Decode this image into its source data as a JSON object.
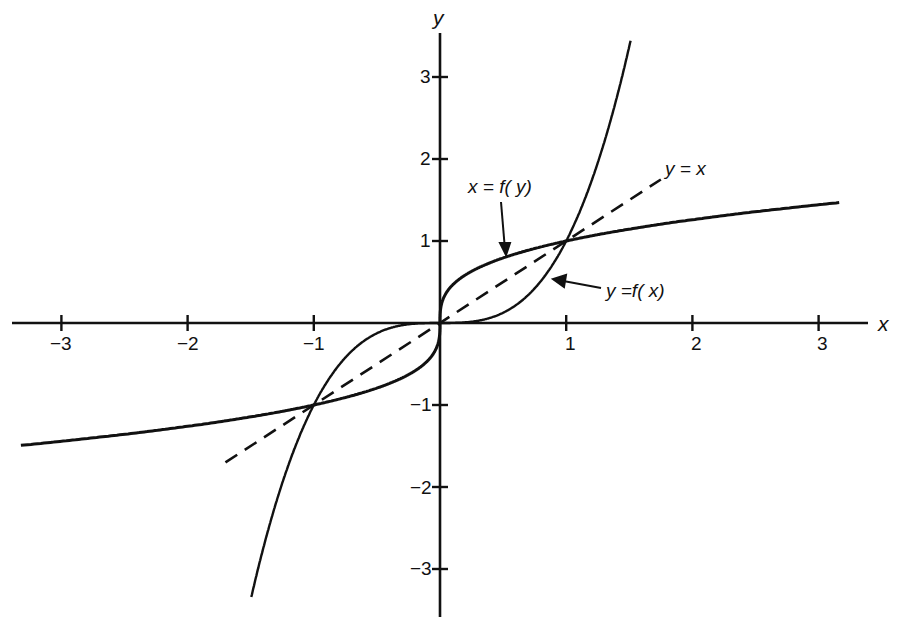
{
  "chart_data": {
    "type": "line",
    "title": "",
    "xlabel": "x",
    "ylabel": "y",
    "xlim": [
      -3.4,
      3.4
    ],
    "ylim": [
      -3.5,
      3.5
    ],
    "grid": false,
    "x_ticks": [
      "-3",
      "-2",
      "-1",
      "1",
      "2",
      "3"
    ],
    "y_ticks": [
      "3",
      "2",
      "1",
      "-1",
      "-2",
      "-3"
    ],
    "series": [
      {
        "name": "y = f(x)",
        "formula": "y = x^3",
        "style": "solid",
        "x": [
          -1.5,
          -1.25,
          -1,
          -0.75,
          -0.5,
          -0.25,
          0,
          0.25,
          0.5,
          0.75,
          1,
          1.25,
          1.5
        ],
        "y": [
          -3.375,
          -1.953,
          -1,
          -0.422,
          -0.125,
          -0.016,
          0,
          0.016,
          0.125,
          0.422,
          1,
          1.953,
          3.375
        ]
      },
      {
        "name": "x = f(y)",
        "formula": "y = x^(1/3)",
        "style": "solid",
        "x": [
          -3.4,
          -2,
          -1,
          -0.5,
          -0.125,
          0,
          0.125,
          0.5,
          1,
          2,
          3.4
        ],
        "y": [
          -1.504,
          -1.26,
          -1,
          -0.794,
          -0.5,
          0,
          0.5,
          0.794,
          1,
          1.26,
          1.504
        ]
      },
      {
        "name": "y = x",
        "formula": "y = x",
        "style": "dashed",
        "x": [
          -1.7,
          1.75
        ],
        "y": [
          -1.7,
          1.75
        ]
      }
    ],
    "annotations": [
      {
        "text": "x = f(y)",
        "points_to": [
          0.55,
          0.82
        ]
      },
      {
        "text": "y =f(x)",
        "points_to": [
          0.9,
          0.73
        ]
      },
      {
        "text": "y = x",
        "at": [
          1.75,
          1.75
        ]
      }
    ]
  },
  "labels": {
    "x_axis": "x",
    "y_axis": "y",
    "xt": [
      "−3",
      "−2",
      "−1",
      "1",
      "2",
      "3"
    ],
    "yt": [
      "3",
      "2",
      "1",
      "−1",
      "−2",
      "−3"
    ],
    "ann_inverse": "x = f( y)",
    "ann_func": "y =f( x)",
    "ann_identity": "y = x"
  }
}
